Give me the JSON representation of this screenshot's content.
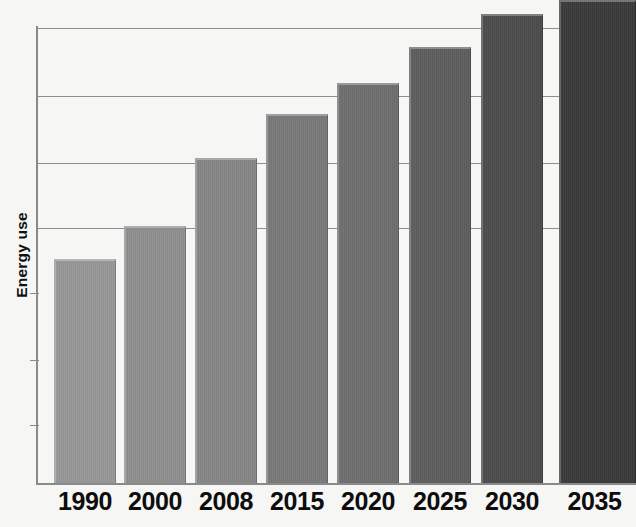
{
  "chart_data": {
    "type": "bar",
    "title": "",
    "subtitle": "",
    "xlabel": "",
    "ylabel": "Energy use",
    "categories": [
      "1990",
      "2000",
      "2008",
      "2015",
      "2020",
      "2025",
      "2030",
      "2035"
    ],
    "values": [
      49,
      56,
      71,
      81,
      88,
      96,
      103,
      108
    ],
    "ylim": [
      0,
      110
    ],
    "xlim_note": "categorical",
    "grid": true,
    "gridlines_y": [
      103,
      88,
      70,
      56
    ],
    "legend": "none",
    "legend_position": "none",
    "axis_tick_labels_y": [],
    "annotations": [],
    "series": [
      {
        "name": "Energy use",
        "values": [
          49,
          56,
          71,
          81,
          88,
          96,
          103,
          108
        ]
      }
    ],
    "bar_colors": [
      "#969696",
      "#8e8e8e",
      "#858585",
      "#787878",
      "#6e6e6e",
      "#5d5d5d",
      "#4b4b4b",
      "#3a3a3a"
    ]
  },
  "axes": {
    "y_axis_title": "Energy use",
    "x_axis_title": ""
  },
  "colors": {
    "background": "#f6f6f4",
    "gridline": "#8e8e8e",
    "axis": "#8a8a8a",
    "label_text": "#0d0d0d"
  },
  "geometry": {
    "bars": [
      {
        "label": "1990",
        "left": 54,
        "width": 62,
        "top": 259,
        "height": 224
      },
      {
        "label": "2000",
        "left": 124,
        "width": 62,
        "top": 226,
        "height": 257
      },
      {
        "label": "2008",
        "left": 195,
        "width": 62,
        "top": 158,
        "height": 325
      },
      {
        "label": "2015",
        "left": 266,
        "width": 62,
        "top": 114,
        "height": 369
      },
      {
        "label": "2020",
        "left": 337,
        "width": 62,
        "top": 83,
        "height": 400
      },
      {
        "label": "2025",
        "left": 409,
        "width": 62,
        "top": 47,
        "height": 436
      },
      {
        "label": "2030",
        "left": 481,
        "width": 62,
        "top": 14,
        "height": 469
      },
      {
        "label": "2035",
        "left": 559,
        "width": 77,
        "top": 0,
        "height": 483
      }
    ],
    "gridlines": [
      28,
      96,
      163,
      228
    ],
    "ticks": [
      293,
      360,
      425
    ],
    "baseline_y": 483,
    "label_positions": [
      54,
      124,
      195,
      266,
      337,
      409,
      481,
      556
    ]
  }
}
